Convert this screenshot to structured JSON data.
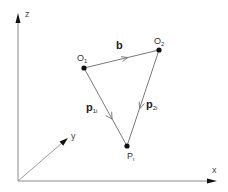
{
  "diagram": {
    "title": "",
    "axes": {
      "z": {
        "label": "z",
        "from": [
          18,
          181
        ],
        "to": [
          18,
          14
        ]
      },
      "x": {
        "label": "x",
        "from": [
          18,
          181
        ],
        "to": [
          217,
          181
        ]
      },
      "y": {
        "label": "y",
        "from": [
          18,
          181
        ],
        "to": [
          68,
          138
        ]
      }
    },
    "points": {
      "O1": {
        "label": "O",
        "sub": "1",
        "pos": [
          84,
          68
        ]
      },
      "O2": {
        "label": "O",
        "sub": "2",
        "pos": [
          159,
          50
        ]
      },
      "Pi": {
        "label": "P",
        "sub": "i",
        "pos": [
          127,
          146
        ]
      }
    },
    "vectors": {
      "b": {
        "label": "b",
        "sub": "",
        "from": "O1",
        "to": "O2"
      },
      "p1i": {
        "label": "p",
        "sub": "1i",
        "from": "O1",
        "to": "Pi"
      },
      "p2i": {
        "label": "p",
        "sub": "2i",
        "from": "O2",
        "to": "Pi"
      }
    },
    "colors": {
      "line": "#7a7a7a",
      "point": "#111111",
      "text": "#222222"
    }
  }
}
